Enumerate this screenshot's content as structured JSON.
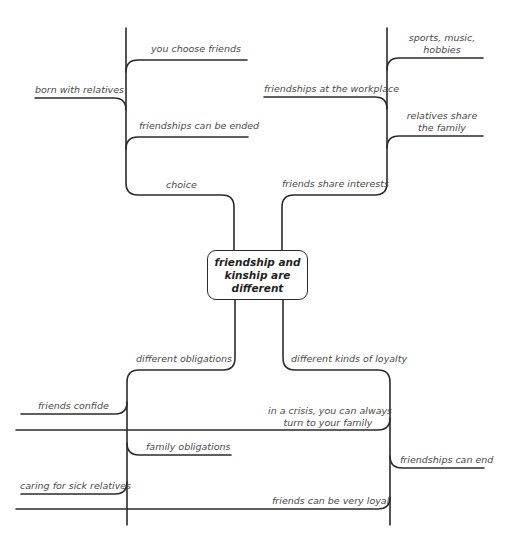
{
  "diagram": {
    "type": "mind-map",
    "central_topic": {
      "lines": [
        "friendship and",
        "kinship are",
        "different"
      ],
      "full_text": "friendship and kinship are different"
    },
    "branches": [
      {
        "label": "choice",
        "position": "top-left",
        "children": [
          "you choose friends",
          "born with relatives",
          "friendships can be ended"
        ]
      },
      {
        "label": "friends share interests",
        "position": "top-right",
        "children": [
          "sports, music, hobbies",
          "friendships at the workplace",
          "relatives share the family"
        ]
      },
      {
        "label": "different obligations",
        "position": "bottom-left",
        "children": [
          "friends confide",
          "family obligations",
          "caring for sick relatives"
        ]
      },
      {
        "label": "different kinds of loyalty",
        "position": "bottom-right",
        "children": [
          "in a crisis, you can always turn to your family",
          "friendships can end",
          "friends can be very loyal"
        ]
      }
    ]
  },
  "labels": {
    "center_1": "friendship and",
    "center_2": "kinship are",
    "center_3": "different",
    "choice": "choice",
    "you_choose_friends": "you choose friends",
    "born_with_relatives": "born with relatives",
    "friendships_can_be_ended": "friendships can be ended",
    "friends_share_interests": "friends share interests",
    "sports_1": "sports, music,",
    "sports_2": "hobbies",
    "friendships_workplace": "friendships at the workplace",
    "relatives_share_1": "relatives share",
    "relatives_share_2": "the family",
    "different_obligations": "different obligations",
    "friends_confide": "friends confide",
    "family_obligations": "family obligations",
    "caring_sick": "caring for sick relatives",
    "different_loyalty": "different kinds of loyalty",
    "crisis_1": "in a crisis, you can always",
    "crisis_2": "turn to your family",
    "friendships_can_end": "friendships can end",
    "friends_loyal": "friends can be very loyal"
  },
  "colors": {
    "line": "#2b2b2b",
    "text": "#4a4a4a",
    "background": "#ffffff"
  }
}
